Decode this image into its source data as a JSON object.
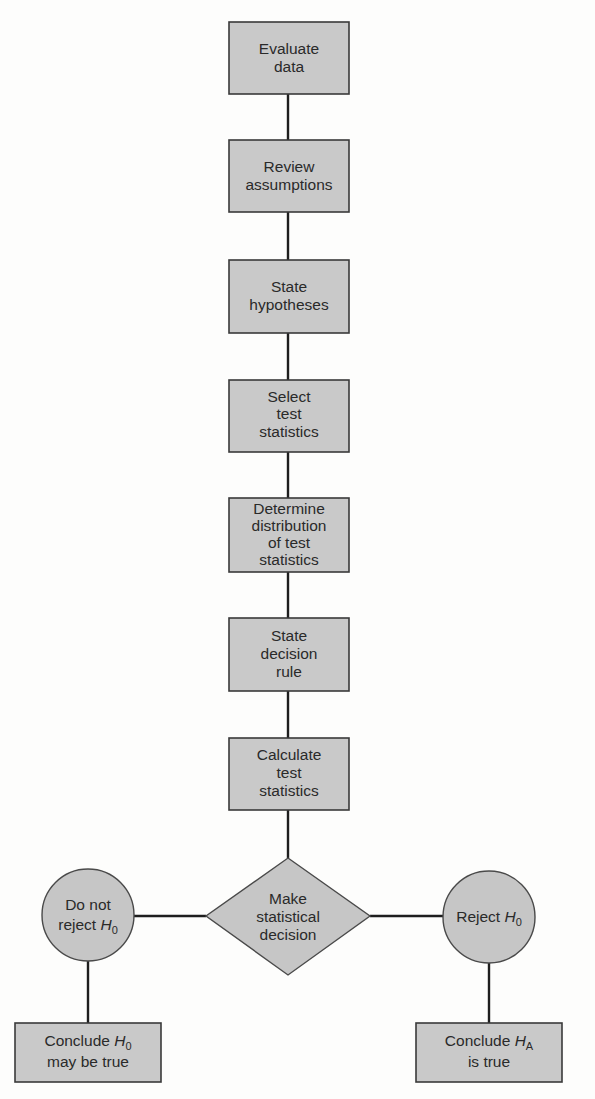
{
  "diagram": {
    "colors": {
      "box_fill": "#c9c9c9",
      "box_stroke": "#3a3a3a",
      "connector": "#1e1e1e",
      "text": "#2a2a2a",
      "background": "#fdfdfc"
    },
    "steps": [
      {
        "id": "evaluate-data",
        "lines": [
          "Evaluate",
          "data"
        ]
      },
      {
        "id": "review-assumptions",
        "lines": [
          "Review",
          "assumptions"
        ]
      },
      {
        "id": "state-hypotheses",
        "lines": [
          "State",
          "hypotheses"
        ]
      },
      {
        "id": "select-test-statistics",
        "lines": [
          "Select",
          "test",
          "statistics"
        ]
      },
      {
        "id": "determine-distribution",
        "lines": [
          "Determine",
          "distribution",
          "of test",
          "statistics"
        ]
      },
      {
        "id": "state-decision-rule",
        "lines": [
          "State",
          "decision",
          "rule"
        ]
      },
      {
        "id": "calculate-test-statistics",
        "lines": [
          "Calculate",
          "test",
          "statistics"
        ]
      }
    ],
    "decision": {
      "id": "make-statistical-decision",
      "lines": [
        "Make",
        "statistical",
        "decision"
      ]
    },
    "outcomes": {
      "left": {
        "circle": {
          "line1": "Do not",
          "line2_prefix": "reject ",
          "var": "H",
          "sub": "0"
        },
        "conclusion": {
          "line1_prefix": "Conclude ",
          "var": "H",
          "sub": "0",
          "line2": "may be true"
        }
      },
      "right": {
        "circle": {
          "line1_prefix": "Reject ",
          "var": "H",
          "sub": "0"
        },
        "conclusion": {
          "line1_prefix": "Conclude ",
          "var": "H",
          "sub": "A",
          "line2": "is true"
        }
      }
    }
  }
}
